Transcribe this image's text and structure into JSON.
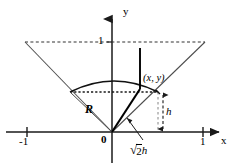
{
  "figure": {
    "axes": {
      "x_label": "x",
      "y_label": "y",
      "origin_label": "0",
      "x_ticks": [
        {
          "label": "-1",
          "value": -1
        },
        {
          "label": "1",
          "value": 1
        }
      ],
      "y_ticks": [
        {
          "label": "1",
          "value": 1
        }
      ]
    },
    "annotations": {
      "point_label": "(x, y)",
      "radius_label": "R",
      "height_label": "h",
      "slant_radical": "√",
      "slant_radicand": "2",
      "slant_suffix": "h",
      "slant_label": "√2 h"
    },
    "colors": {
      "stroke": "#1a1a1a",
      "thin_stroke": "#555555",
      "background": "#ffffff",
      "text": "#000000"
    },
    "geometry": {
      "origin_px": {
        "x": 112,
        "y": 132
      },
      "cone_top_y_px": 42,
      "cone_left_top_px": {
        "x": 25,
        "y": 42
      },
      "cone_right_top_px": {
        "x": 205,
        "y": 42
      },
      "cap_left_px": {
        "x": 70,
        "y": 92
      },
      "cap_right_px": {
        "x": 158,
        "y": 92
      },
      "cap_apex_px": {
        "x": 114,
        "y": 82
      },
      "point_xy_px": {
        "x": 140,
        "y": 89
      },
      "x_axis_y_px": 132,
      "x_tick_neg1_px": 27,
      "x_tick_pos1_px": 203
    }
  }
}
